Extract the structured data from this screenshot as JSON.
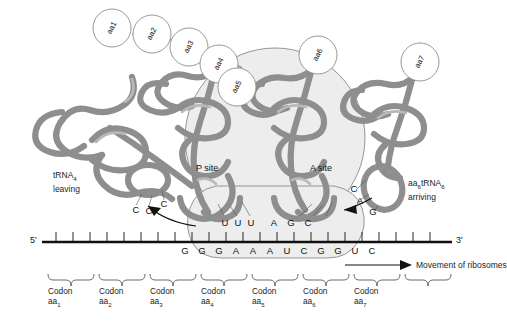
{
  "figure": {
    "type": "biology-diagram"
  },
  "polypeptide": {
    "amino_acids": [
      "aa1",
      "aa2",
      "aa3",
      "aa4",
      "aa5"
    ],
    "ribosome_bound": [
      "aa6"
    ],
    "incoming": [
      "aa7"
    ]
  },
  "ribosome": {
    "p_site_label": "P site",
    "a_site_label": "A site"
  },
  "trna_leaving": {
    "label_line1": "tRNA",
    "label_sub": "4",
    "label_line2": "leaving",
    "anticodon": [
      "C",
      "C",
      "C"
    ]
  },
  "trna_arriving": {
    "label_line1_pre": "aa",
    "label_line1_sub1": "6",
    "label_line1_mid": "tRNA",
    "label_line1_sub2": "6",
    "label_line2": "arriving",
    "anticodon": [
      "C",
      "A",
      "G"
    ]
  },
  "p_site_anticodon": [
    "U",
    "U",
    "U"
  ],
  "a_site_anticodon": [
    "A",
    "G",
    "C"
  ],
  "mrna": {
    "five_prime": "5'",
    "three_prime": "3'",
    "bases": [
      "G",
      "G",
      "G",
      "A",
      "A",
      "A",
      "U",
      "C",
      "G",
      "G",
      "U",
      "C"
    ]
  },
  "movement": {
    "label": "Movement of ribosomes"
  },
  "codons": [
    {
      "line1": "Codon",
      "line2_pre": "aa",
      "line2_sub": "1"
    },
    {
      "line1": "Codon",
      "line2_pre": "aa",
      "line2_sub": "2"
    },
    {
      "line1": "Codon",
      "line2_pre": "aa",
      "line2_sub": "3"
    },
    {
      "line1": "Codon",
      "line2_pre": "aa",
      "line2_sub": "4"
    },
    {
      "line1": "Codon",
      "line2_pre": "aa",
      "line2_sub": "5"
    },
    {
      "line1": "Codon",
      "line2_pre": "aa",
      "line2_sub": "6"
    },
    {
      "line1": "Codon",
      "line2_pre": "aa",
      "line2_sub": "7"
    }
  ],
  "colors": {
    "trna_stroke": "#8e8e8e",
    "ribosome_fill": "#ededed",
    "mrna_line": "#111111",
    "text": "#1a1a1a"
  }
}
